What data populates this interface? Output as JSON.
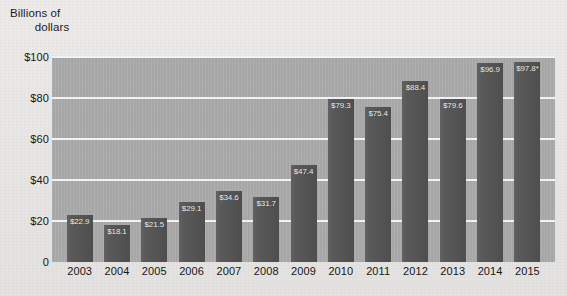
{
  "chart_data": {
    "type": "bar",
    "title": "",
    "ylabel_line1": "Billions of",
    "ylabel_line2": "dollars",
    "xlabel": "",
    "categories": [
      "2003",
      "2004",
      "2005",
      "2006",
      "2007",
      "2008",
      "2009",
      "2010",
      "2011",
      "2012",
      "2013",
      "2014",
      "2015"
    ],
    "values": [
      22.9,
      18.1,
      21.5,
      29.1,
      34.6,
      31.7,
      47.4,
      79.3,
      75.4,
      88.4,
      79.6,
      96.9,
      97.8
    ],
    "value_labels": [
      "$22.9",
      "$18.1",
      "$21.5",
      "$29.1",
      "$34.6",
      "$31.7",
      "$47.4",
      "$79.3",
      "$75.4",
      "$88.4",
      "$79.6",
      "$96.9",
      "$97.8*"
    ],
    "ylim": [
      0,
      100
    ],
    "yticks": [
      100,
      80,
      60,
      40,
      20,
      0
    ],
    "ytick_labels": [
      "$100",
      "$80",
      "$60",
      "$40",
      "$20",
      "0"
    ],
    "grid": true,
    "legend": "none",
    "colors": {
      "bar": "#545454",
      "plot_background": "#ababab",
      "gridline": "#f2f2f2",
      "page_background": "#e9e9e7",
      "label_text": "#f4f4f4",
      "axis_text": "#161616"
    },
    "annotations": [
      "* asterisk on 2015 value"
    ]
  }
}
